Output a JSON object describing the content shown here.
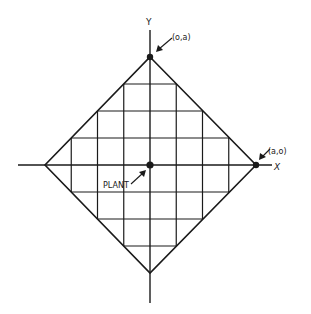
{
  "diagram": {
    "axes": {
      "x_label": "X",
      "y_label": "Y"
    },
    "points": {
      "top": {
        "label": "(o,a)"
      },
      "right": {
        "label": "(a,o)"
      },
      "center": {
        "label": "PLANT"
      }
    },
    "grid_divisions_per_half": 4,
    "colors": {
      "line": "#1a1a1a",
      "background": "#ffffff"
    }
  }
}
